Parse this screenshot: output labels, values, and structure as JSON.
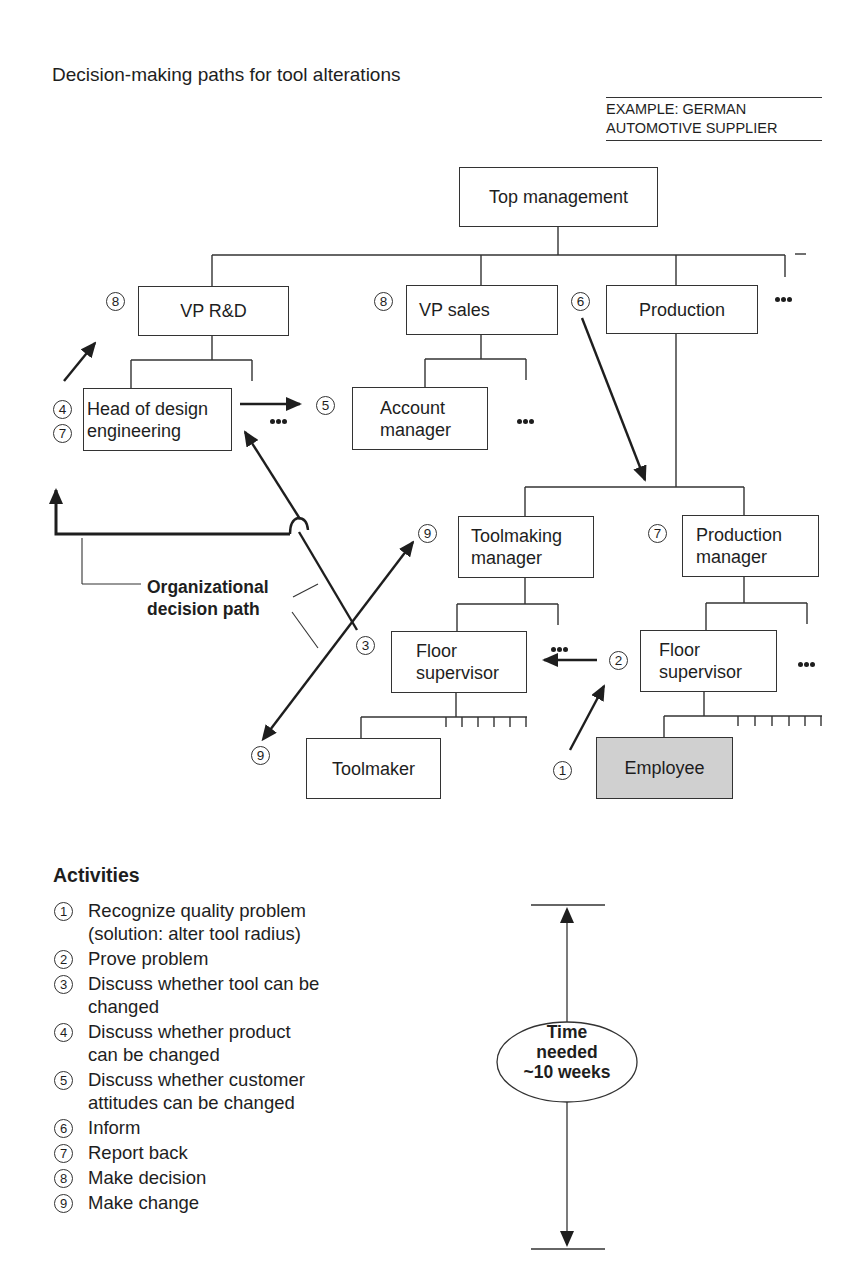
{
  "title": "Decision-making paths for tool alterations",
  "example": {
    "line1": "EXAMPLE:  GERMAN",
    "line2": "AUTOMOTIVE SUPPLIER"
  },
  "org_chart": {
    "top_management": "Top management",
    "vp_rd": "VP R&D",
    "vp_sales": "VP sales",
    "production": "Production",
    "head_design": {
      "line1": "Head of design",
      "line2": "engineering"
    },
    "account_manager": {
      "line1": "Account",
      "line2": "manager"
    },
    "toolmaking_manager": {
      "line1": "Toolmaking",
      "line2": "manager"
    },
    "production_manager": {
      "line1": "Production",
      "line2": "manager"
    },
    "floor_supervisor_left": {
      "line1": "Floor",
      "line2": "supervisor"
    },
    "floor_supervisor_right": {
      "line1": "Floor",
      "line2": "supervisor"
    },
    "toolmaker": "Toolmaker",
    "employee": "Employee",
    "employee_fill": "#d0d0d0"
  },
  "step_markers": {
    "vp_rd": "8",
    "vp_sales": "8",
    "production": "6",
    "head_design_a": "4",
    "head_design_b": "7",
    "customer": "5",
    "toolmaking_manager": "9",
    "production_manager": "7",
    "discuss_tool": "3",
    "prove": "2",
    "recognize": "1",
    "toolmaker": "9"
  },
  "org_decision_path": {
    "line1": "Organizational",
    "line2": "decision path"
  },
  "activities": {
    "heading": "Activities",
    "items": [
      {
        "num": "1",
        "line1": "Recognize quality problem",
        "line2": "(solution:  alter tool radius)"
      },
      {
        "num": "2",
        "line1": "Prove problem",
        "line2": ""
      },
      {
        "num": "3",
        "line1": "Discuss whether tool can be",
        "line2": "changed"
      },
      {
        "num": "4",
        "line1": "Discuss whether product",
        "line2": "can be changed"
      },
      {
        "num": "5",
        "line1": "Discuss whether customer",
        "line2": "attitudes can be changed"
      },
      {
        "num": "6",
        "line1": "Inform",
        "line2": ""
      },
      {
        "num": "7",
        "line1": "Report back",
        "line2": ""
      },
      {
        "num": "8",
        "line1": "Make decision",
        "line2": ""
      },
      {
        "num": "9",
        "line1": "Make change",
        "line2": ""
      }
    ]
  },
  "time_needed": {
    "line1": "Time",
    "line2": "needed",
    "line3": "~10 weeks"
  }
}
